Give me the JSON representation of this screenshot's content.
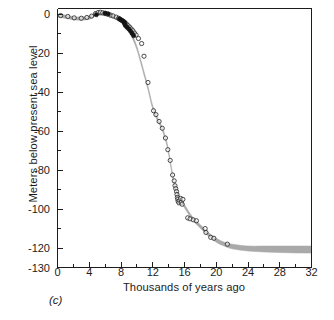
{
  "figure": {
    "panel_label": "(c)",
    "band_color": "#a9a9a9",
    "axis_color": "#1c1c1c",
    "background": "#ffffff"
  },
  "chart_data": {
    "type": "line",
    "title": "",
    "subtitle": "",
    "xlabel": "Thousands of years ago",
    "ylabel": "Meters below present sea level",
    "xlim": [
      0,
      32
    ],
    "ylim": [
      -130,
      3
    ],
    "grid": false,
    "legend": "none",
    "x_ticks": [
      0,
      4,
      8,
      12,
      16,
      20,
      24,
      28,
      32
    ],
    "x_tick_labels": [
      "0",
      "4",
      "8",
      "12",
      "16",
      "20",
      "24",
      "28",
      "32"
    ],
    "x_minor_ticks": [
      2,
      6,
      10,
      14,
      18,
      22,
      26,
      30
    ],
    "y_ticks": [
      0,
      -20,
      -40,
      -60,
      -80,
      -100,
      -120,
      -130
    ],
    "y_tick_labels": [
      "0",
      "-20",
      "-40",
      "-60",
      "-80",
      "-100",
      "-120",
      "-130"
    ],
    "y_minor_ticks": [
      -10,
      -30,
      -50,
      -70,
      -90,
      -110
    ],
    "series": [
      {
        "name": "Sea level envelope (upper bound)",
        "style": "band-edge",
        "x": [
          0,
          1,
          2,
          3,
          4,
          4.6,
          5.2,
          5.8,
          6.4,
          7,
          7.6,
          8.2,
          8.8,
          9.4,
          10,
          10.6,
          11,
          11.4,
          12,
          12.6,
          13.2,
          13.8,
          14.2,
          14.6,
          15,
          15.6,
          16.2,
          17,
          18,
          19,
          20,
          21,
          22,
          24,
          26,
          28,
          30,
          32
        ],
        "y": [
          0,
          -0.4,
          -1.2,
          -1.4,
          -0.9,
          0.3,
          1.1,
          1.0,
          0.4,
          -0.4,
          -1.6,
          -3.4,
          -6.2,
          -10.5,
          -16.5,
          -25,
          -31,
          -37,
          -47,
          -53,
          -58,
          -66,
          -75,
          -84,
          -90,
          -95,
          -99,
          -104,
          -108,
          -112,
          -115,
          -117,
          -118,
          -119,
          -119,
          -119,
          -119,
          -119
        ],
        "notes": "upper (shallower) edge of shaded sea-level band"
      },
      {
        "name": "Sea level envelope (lower bound)",
        "style": "band-edge",
        "x": [
          0,
          1,
          2,
          3,
          4,
          4.6,
          5.2,
          5.8,
          6.4,
          7,
          7.6,
          8.2,
          8.8,
          9.4,
          10,
          10.6,
          11,
          11.4,
          12,
          12.6,
          13.2,
          13.8,
          14.2,
          14.6,
          15,
          15.6,
          16.2,
          17,
          18,
          19,
          20,
          21,
          22,
          24,
          26,
          28,
          30,
          32
        ],
        "y": [
          -1.6,
          -2.0,
          -2.8,
          -3.0,
          -2.5,
          -1.3,
          -0.5,
          -0.6,
          -1.2,
          -2.0,
          -3.2,
          -5.0,
          -7.8,
          -12.1,
          -18.1,
          -26.6,
          -32.6,
          -38.6,
          -48.6,
          -54.6,
          -59.6,
          -67.6,
          -76.6,
          -85.6,
          -91.6,
          -96.6,
          -100.6,
          -105.6,
          -109.8,
          -113.8,
          -117,
          -119,
          -120.4,
          -121.5,
          -122,
          -122.3,
          -122.5,
          -122.6
        ],
        "notes": "lower (deeper) edge of shaded sea-level band; widens toward 32 ka"
      },
      {
        "name": "Open circle data points",
        "style": "open-circle",
        "points": [
          [
            0.4,
            -0.6
          ],
          [
            1.3,
            -1.1
          ],
          [
            2.1,
            -1.8
          ],
          [
            3.0,
            -2.0
          ],
          [
            3.7,
            -1.6
          ],
          [
            4.3,
            -0.9
          ],
          [
            4.8,
            0.4
          ],
          [
            5.1,
            0.9
          ],
          [
            5.4,
            1.1
          ],
          [
            5.7,
            0.8
          ],
          [
            6.0,
            0.5
          ],
          [
            6.3,
            0.2
          ],
          [
            6.7,
            -0.4
          ],
          [
            7.0,
            -0.8
          ],
          [
            7.4,
            -1.4
          ],
          [
            7.7,
            -2.0
          ],
          [
            7.9,
            -2.6
          ],
          [
            8.1,
            -3.1
          ],
          [
            8.3,
            -3.6
          ],
          [
            8.5,
            -4.2
          ],
          [
            8.7,
            -5.0
          ],
          [
            8.9,
            -5.8
          ],
          [
            9.1,
            -6.6
          ],
          [
            9.3,
            -7.5
          ],
          [
            9.5,
            -8.4
          ],
          [
            9.7,
            -9.6
          ],
          [
            9.9,
            -10.6
          ],
          [
            10.2,
            -12.4
          ],
          [
            10.6,
            -15.0
          ],
          [
            10.9,
            -21.5
          ],
          [
            11.4,
            -35.0
          ],
          [
            12.1,
            -49.5
          ],
          [
            12.4,
            -51.5
          ],
          [
            12.8,
            -55.0
          ],
          [
            13.2,
            -58.5
          ],
          [
            13.6,
            -63.5
          ],
          [
            13.9,
            -69.5
          ],
          [
            14.2,
            -75.0
          ],
          [
            14.5,
            -82.5
          ],
          [
            14.7,
            -85.5
          ],
          [
            14.8,
            -88.0
          ],
          [
            14.9,
            -89.5
          ],
          [
            15.0,
            -91.0
          ],
          [
            15.05,
            -92.5
          ],
          [
            15.1,
            -94.0
          ],
          [
            15.15,
            -95.0
          ],
          [
            15.2,
            -96.0
          ],
          [
            15.3,
            -96.8
          ],
          [
            15.4,
            -95.5
          ],
          [
            15.5,
            -94.5
          ],
          [
            15.6,
            -96.5
          ],
          [
            15.7,
            -97.5
          ],
          [
            15.8,
            -95.0
          ],
          [
            16.4,
            -104.5
          ],
          [
            16.7,
            -105.0
          ],
          [
            17.1,
            -105.5
          ],
          [
            17.5,
            -106.0
          ],
          [
            18.6,
            -110.0
          ],
          [
            18.7,
            -112.0
          ],
          [
            19.3,
            -114.5
          ],
          [
            19.7,
            -115.0
          ],
          [
            21.4,
            -118.0
          ]
        ],
        "notes": "open circles, radius ~2px, plotted along the band"
      },
      {
        "name": "Filled circle data points",
        "style": "filled-circle",
        "points": [
          [
            4.9,
            -0.2
          ],
          [
            6.0,
            0.6
          ],
          [
            6.4,
            0.2
          ],
          [
            7.8,
            -2.3
          ],
          [
            8.0,
            -2.8
          ],
          [
            8.2,
            -3.3
          ],
          [
            8.4,
            -3.9
          ],
          [
            8.45,
            -4.6
          ],
          [
            8.5,
            -5.3
          ],
          [
            8.6,
            -6.0
          ],
          [
            8.8,
            -6.8
          ],
          [
            9.0,
            -7.6
          ],
          [
            9.2,
            -8.6
          ],
          [
            9.4,
            -9.8
          ],
          [
            9.6,
            -11.0
          ]
        ],
        "notes": "solid black markers clustered between 5 and 10 ka"
      }
    ]
  }
}
